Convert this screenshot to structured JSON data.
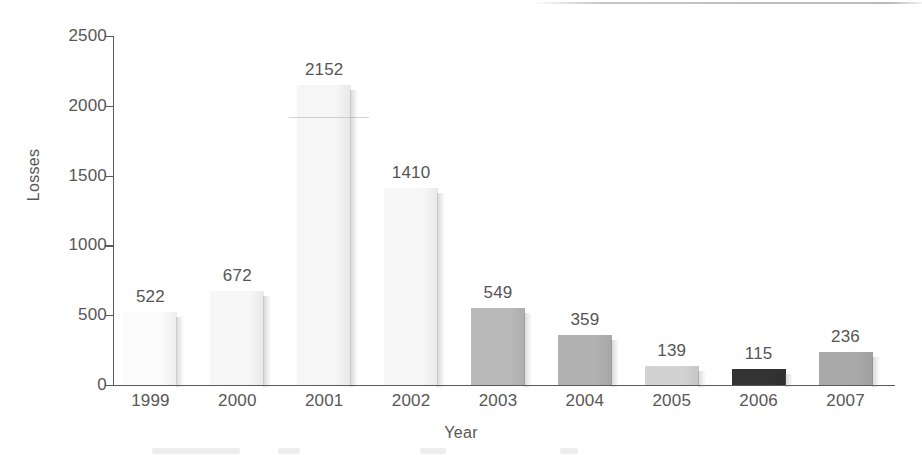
{
  "chart_data": {
    "type": "bar",
    "title": "",
    "xlabel": "Year",
    "ylabel": "Losses",
    "categories": [
      "1999",
      "2000",
      "2001",
      "2002",
      "2003",
      "2004",
      "2005",
      "2006",
      "2007"
    ],
    "values": [
      522,
      672,
      2152,
      1410,
      549,
      359,
      139,
      115,
      236
    ],
    "value_labels": [
      "522",
      "672",
      "2152",
      "1410",
      "549",
      "359",
      "139",
      "115",
      "236"
    ],
    "ylim": [
      0,
      2500
    ],
    "yticks": [
      0,
      500,
      1000,
      1500,
      2000,
      2500
    ],
    "ytick_labels": [
      "0",
      "500",
      "1000",
      "1500",
      "2000",
      "2500"
    ],
    "grid": false,
    "legend": false,
    "bar_colors": [
      "#fbfbfb",
      "#f7f7f7",
      "#f6f6f6",
      "#f7f7f7",
      "#b9b9b9",
      "#b1b1b1",
      "#d2d2d2",
      "#333333",
      "#a9a9a9"
    ],
    "axis_color": "#5a5a5a",
    "label_color": "#575757"
  }
}
